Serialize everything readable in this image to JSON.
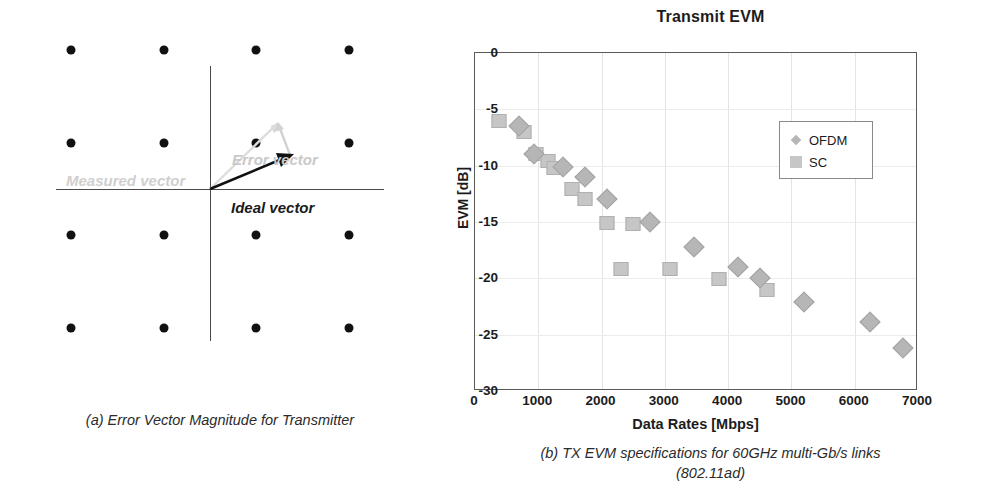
{
  "figure_a": {
    "caption": "(a) Error Vector Magnitude for Transmitter",
    "labels": {
      "ideal": "Ideal vector",
      "error": "Error vector",
      "measured": "Measured vector"
    },
    "constellation": {
      "name": "16-QAM constellation",
      "grid": [
        -3,
        -1,
        1,
        3
      ],
      "points": [
        [
          -3,
          3
        ],
        [
          -1,
          3
        ],
        [
          1,
          3
        ],
        [
          3,
          3
        ],
        [
          -3,
          1
        ],
        [
          -1,
          1
        ],
        [
          1,
          1
        ],
        [
          3,
          1
        ],
        [
          -3,
          -1
        ],
        [
          -1,
          -1
        ],
        [
          1,
          -1
        ],
        [
          3,
          -1
        ],
        [
          -3,
          -3
        ],
        [
          -1,
          -3
        ],
        [
          1,
          -3
        ],
        [
          3,
          -3
        ]
      ],
      "ideal_vector_tip": [
        1,
        1
      ],
      "measured_vector_tip": [
        0.82,
        1.52
      ],
      "colors": {
        "dot": "#111111",
        "axis": "#4a4a4a",
        "ideal": "#1a1a1a",
        "error": "#c9c9c9",
        "measured": "#cfcfcf"
      }
    }
  },
  "figure_b": {
    "caption_line1": "(b) TX EVM specifications for 60GHz multi-Gb/s links",
    "caption_line2": "(802.11ad)"
  },
  "chart_data": {
    "type": "scatter",
    "title": "Transmit EVM",
    "xlabel": "Data Rates [Mbps]",
    "ylabel": "EVM [dB]",
    "xlim": [
      0,
      7000
    ],
    "ylim": [
      -30,
      0
    ],
    "xticks": [
      0,
      1000,
      2000,
      3000,
      4000,
      5000,
      6000,
      7000
    ],
    "yticks": [
      0,
      -5,
      -10,
      -15,
      -20,
      -25,
      -30
    ],
    "grid": true,
    "legend_position": "upper-right-inside",
    "series": [
      {
        "name": "SC",
        "marker": "square",
        "color": "#c6c6c6",
        "points": [
          [
            385,
            -6.0
          ],
          [
            770,
            -7.0
          ],
          [
            962,
            -9.0
          ],
          [
            1155,
            -9.6
          ],
          [
            1251,
            -10.2
          ],
          [
            1540,
            -12.1
          ],
          [
            1732,
            -13.0
          ],
          [
            2079,
            -15.1
          ],
          [
            2503,
            -15.2
          ],
          [
            2310,
            -19.2
          ],
          [
            3080,
            -19.2
          ],
          [
            3850,
            -20.1
          ],
          [
            4620,
            -21.0
          ]
        ]
      },
      {
        "name": "OFDM",
        "marker": "diamond",
        "color": "#b6b6b6",
        "points": [
          [
            693,
            -6.5
          ],
          [
            940,
            -9.0
          ],
          [
            1386,
            -10.1
          ],
          [
            1732,
            -11.0
          ],
          [
            2079,
            -13.0
          ],
          [
            2772,
            -15.0
          ],
          [
            3465,
            -17.2
          ],
          [
            4158,
            -19.0
          ],
          [
            4505,
            -20.0
          ],
          [
            5198,
            -22.1
          ],
          [
            6237,
            -23.9
          ],
          [
            6762,
            -26.2
          ]
        ]
      }
    ],
    "legend": [
      {
        "label": "OFDM",
        "marker": "diamond"
      },
      {
        "label": "SC",
        "marker": "square"
      }
    ]
  }
}
